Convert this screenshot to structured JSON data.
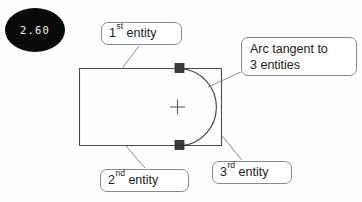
{
  "badge": {
    "label": "2.60",
    "background": "#0a0a0a",
    "text_color": "#f2f2f2"
  },
  "diagram": {
    "line_color": "#4d4d4d",
    "marker_color": "#3a3a3a",
    "center_mark": "+",
    "callouts": [
      {
        "id": "first-entity",
        "ordinal": "1",
        "suffix": "st",
        "word": "entity",
        "lines": [
          "1st entity"
        ]
      },
      {
        "id": "arc-tangent",
        "lines": [
          "Arc tangent to",
          "3 entities"
        ]
      },
      {
        "id": "second-entity",
        "ordinal": "2",
        "suffix": "nd",
        "word": "entity",
        "lines": [
          "2nd entity"
        ]
      },
      {
        "id": "third-entity",
        "ordinal": "3",
        "suffix": "rd",
        "word": "entity",
        "lines": [
          "3rd entity"
        ]
      }
    ]
  }
}
